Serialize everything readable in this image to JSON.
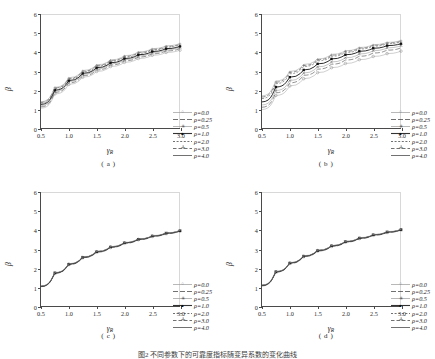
{
  "figure": {
    "caption": "图2  不同参数下的可靠度指标随变异系数的变化曲线",
    "background": "#ffffff",
    "axis_color": "#4a4a4a"
  },
  "axes": {
    "xlabel_symbol": "γ",
    "xlabel_sub": "R",
    "ylabel": "β",
    "xticks": [
      "0.5",
      "1.0",
      "1.5",
      "2.0",
      "2.5",
      "3.0"
    ],
    "yticks": [
      "0",
      "1",
      "2",
      "3",
      "4",
      "5",
      "6"
    ],
    "xlim": [
      0.5,
      3.0
    ],
    "ylim": [
      0,
      6
    ]
  },
  "legend": {
    "entries": [
      {
        "label": "ρ=0.0",
        "style": "open-circle",
        "marker": "○",
        "dash": "none"
      },
      {
        "label": "ρ=0.25",
        "style": "dash-long",
        "marker": "",
        "dash": "6 3"
      },
      {
        "label": "ρ=0.5",
        "style": "star",
        "marker": "✳",
        "dash": "none"
      },
      {
        "label": "ρ=1.0",
        "style": "solid-square",
        "marker": "■",
        "dash": "none"
      },
      {
        "label": "ρ=2.0",
        "style": "dash-short",
        "marker": "",
        "dash": "2 2"
      },
      {
        "label": "ρ=3.0",
        "style": "dash-cross",
        "marker": "✛",
        "dash": "4 2"
      },
      {
        "label": "ρ=4.0",
        "style": "solid-thin",
        "marker": "",
        "dash": "none"
      }
    ]
  },
  "panels": [
    {
      "id": "a",
      "label": "( a )",
      "spread": "wide"
    },
    {
      "id": "b",
      "label": "( b )",
      "spread": "wider"
    },
    {
      "id": "c",
      "label": "( c )",
      "spread": "collapsed"
    },
    {
      "id": "d",
      "label": "( d )",
      "spread": "collapsed"
    }
  ],
  "chart_data": [
    {
      "type": "line",
      "panel": "a",
      "title": "( a )",
      "xlabel": "γR",
      "ylabel": "β",
      "xlim": [
        0.5,
        3.0
      ],
      "ylim": [
        0,
        6
      ],
      "grid": false,
      "legend_position": "lower-right",
      "x": [
        0.5,
        0.75,
        1.0,
        1.25,
        1.5,
        1.75,
        2.0,
        2.25,
        2.5,
        2.75,
        3.0
      ],
      "series": [
        {
          "name": "ρ=0.0",
          "values": [
            1.05,
            1.8,
            2.3,
            2.68,
            2.98,
            3.24,
            3.46,
            3.66,
            3.83,
            3.98,
            4.1
          ]
        },
        {
          "name": "ρ=0.25",
          "values": [
            1.12,
            1.88,
            2.38,
            2.76,
            3.06,
            3.32,
            3.54,
            3.74,
            3.91,
            4.06,
            4.18
          ]
        },
        {
          "name": "ρ=0.5",
          "values": [
            1.18,
            1.94,
            2.44,
            2.82,
            3.12,
            3.38,
            3.6,
            3.8,
            3.97,
            4.12,
            4.24
          ]
        },
        {
          "name": "ρ=1.0",
          "values": [
            1.25,
            2.0,
            2.5,
            2.88,
            3.18,
            3.44,
            3.66,
            3.86,
            4.03,
            4.18,
            4.3
          ]
        },
        {
          "name": "ρ=2.0",
          "values": [
            1.32,
            2.08,
            2.58,
            2.96,
            3.26,
            3.52,
            3.74,
            3.94,
            4.11,
            4.26,
            4.38
          ]
        },
        {
          "name": "ρ=3.0",
          "values": [
            1.36,
            2.12,
            2.62,
            3.0,
            3.3,
            3.56,
            3.78,
            3.98,
            4.15,
            4.3,
            4.42
          ]
        },
        {
          "name": "ρ=4.0",
          "values": [
            1.39,
            2.15,
            2.65,
            3.03,
            3.33,
            3.59,
            3.81,
            4.01,
            4.18,
            4.33,
            4.45
          ]
        }
      ]
    },
    {
      "type": "line",
      "panel": "b",
      "title": "( b )",
      "xlabel": "γR",
      "ylabel": "β",
      "xlim": [
        0.5,
        3.0
      ],
      "ylim": [
        0,
        6
      ],
      "grid": false,
      "legend_position": "lower-right",
      "x": [
        0.5,
        0.75,
        1.0,
        1.25,
        1.5,
        1.75,
        2.0,
        2.25,
        2.5,
        2.75,
        3.0
      ],
      "series": [
        {
          "name": "ρ=0.0",
          "values": [
            0.98,
            1.72,
            2.22,
            2.6,
            2.92,
            3.18,
            3.4,
            3.6,
            3.77,
            3.92,
            4.05
          ]
        },
        {
          "name": "ρ=0.25",
          "values": [
            1.1,
            1.86,
            2.38,
            2.78,
            3.1,
            3.36,
            3.58,
            3.78,
            3.95,
            4.1,
            4.22
          ]
        },
        {
          "name": "ρ=0.5",
          "values": [
            1.22,
            1.98,
            2.5,
            2.9,
            3.22,
            3.48,
            3.7,
            3.9,
            4.07,
            4.22,
            4.34
          ]
        },
        {
          "name": "ρ=1.0",
          "values": [
            1.38,
            2.16,
            2.68,
            3.06,
            3.38,
            3.64,
            3.86,
            4.04,
            4.2,
            4.34,
            4.44
          ]
        },
        {
          "name": "ρ=2.0",
          "values": [
            1.56,
            2.34,
            2.86,
            3.24,
            3.54,
            3.78,
            3.98,
            4.16,
            4.31,
            4.44,
            4.54
          ]
        },
        {
          "name": "ρ=3.0",
          "values": [
            1.64,
            2.42,
            2.94,
            3.3,
            3.6,
            3.84,
            4.04,
            4.21,
            4.36,
            4.48,
            4.58
          ]
        },
        {
          "name": "ρ=4.0",
          "values": [
            1.7,
            2.48,
            2.98,
            3.35,
            3.64,
            3.88,
            4.07,
            4.24,
            4.39,
            4.51,
            4.61
          ]
        }
      ]
    },
    {
      "type": "line",
      "panel": "c",
      "title": "( c )",
      "xlabel": "γR",
      "ylabel": "β",
      "xlim": [
        0.5,
        3.0
      ],
      "ylim": [
        0,
        6
      ],
      "grid": false,
      "legend_position": "lower-right",
      "x": [
        0.5,
        0.75,
        1.0,
        1.25,
        1.5,
        1.75,
        2.0,
        2.25,
        2.5,
        2.75,
        3.0
      ],
      "series": [
        {
          "name": "ρ=0.0",
          "values": [
            1.02,
            1.72,
            2.18,
            2.54,
            2.83,
            3.08,
            3.3,
            3.49,
            3.66,
            3.81,
            3.94
          ]
        },
        {
          "name": "ρ=0.25",
          "values": [
            1.03,
            1.73,
            2.19,
            2.55,
            2.84,
            3.09,
            3.31,
            3.5,
            3.67,
            3.82,
            3.95
          ]
        },
        {
          "name": "ρ=0.5",
          "values": [
            1.03,
            1.74,
            2.2,
            2.56,
            2.85,
            3.1,
            3.32,
            3.51,
            3.68,
            3.83,
            3.96
          ]
        },
        {
          "name": "ρ=1.0",
          "values": [
            1.04,
            1.75,
            2.21,
            2.57,
            2.86,
            3.11,
            3.33,
            3.52,
            3.69,
            3.84,
            3.96
          ]
        },
        {
          "name": "ρ=2.0",
          "values": [
            1.05,
            1.76,
            2.22,
            2.58,
            2.87,
            3.12,
            3.34,
            3.53,
            3.7,
            3.85,
            3.97
          ]
        },
        {
          "name": "ρ=3.0",
          "values": [
            1.05,
            1.76,
            2.22,
            2.58,
            2.88,
            3.13,
            3.34,
            3.53,
            3.7,
            3.85,
            3.98
          ]
        },
        {
          "name": "ρ=4.0",
          "values": [
            1.06,
            1.77,
            2.23,
            2.59,
            2.88,
            3.13,
            3.35,
            3.54,
            3.71,
            3.86,
            3.98
          ]
        }
      ]
    },
    {
      "type": "line",
      "panel": "d",
      "title": "( d )",
      "xlabel": "γR",
      "ylabel": "β",
      "xlim": [
        0.5,
        3.0
      ],
      "ylim": [
        0,
        6
      ],
      "grid": false,
      "legend_position": "lower-right",
      "x": [
        0.5,
        0.75,
        1.0,
        1.25,
        1.5,
        1.75,
        2.0,
        2.25,
        2.5,
        2.75,
        3.0
      ],
      "series": [
        {
          "name": "ρ=0.0",
          "values": [
            1.06,
            1.78,
            2.24,
            2.6,
            2.89,
            3.14,
            3.36,
            3.55,
            3.72,
            3.87,
            4.0
          ]
        },
        {
          "name": "ρ=0.25",
          "values": [
            1.07,
            1.79,
            2.25,
            2.61,
            2.9,
            3.15,
            3.37,
            3.56,
            3.73,
            3.88,
            4.01
          ]
        },
        {
          "name": "ρ=0.5",
          "values": [
            1.08,
            1.8,
            2.26,
            2.62,
            2.91,
            3.16,
            3.38,
            3.57,
            3.74,
            3.89,
            4.01
          ]
        },
        {
          "name": "ρ=1.0",
          "values": [
            1.09,
            1.81,
            2.27,
            2.63,
            2.92,
            3.17,
            3.39,
            3.58,
            3.75,
            3.9,
            4.02
          ]
        },
        {
          "name": "ρ=2.0",
          "values": [
            1.1,
            1.82,
            2.28,
            2.64,
            2.93,
            3.18,
            3.4,
            3.59,
            3.76,
            3.91,
            4.03
          ]
        },
        {
          "name": "ρ=3.0",
          "values": [
            1.1,
            1.82,
            2.28,
            2.64,
            2.94,
            3.19,
            3.4,
            3.59,
            3.76,
            3.91,
            4.03
          ]
        },
        {
          "name": "ρ=4.0",
          "values": [
            1.11,
            1.83,
            2.29,
            2.65,
            2.94,
            3.19,
            3.41,
            3.6,
            3.77,
            3.92,
            4.04
          ]
        }
      ]
    }
  ]
}
